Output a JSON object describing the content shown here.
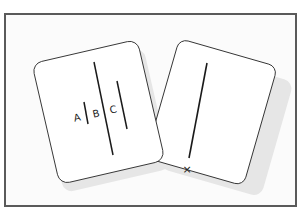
{
  "diagram": {
    "title": "",
    "left_card": {
      "description": "comparison card with three lines",
      "labels": [
        "A",
        "B",
        "C"
      ]
    },
    "right_card": {
      "description": "standard card with one reference line",
      "marker": "×"
    },
    "colors": {
      "frame": "#5a5a5a",
      "background": "#fbfbfb",
      "card": "#ffffff",
      "shadow": "#e4e4e4",
      "line": "#1a1a1a"
    }
  }
}
